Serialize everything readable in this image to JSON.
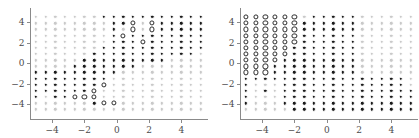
{
  "figure": {
    "type": "two-panel-scatter-grid",
    "width": 419,
    "height": 138,
    "panels": [
      "left",
      "right"
    ]
  },
  "axes": {
    "xticks": [
      -4,
      -2,
      0,
      2,
      4
    ],
    "xticklabels": [
      "-4",
      "-2",
      "0",
      "2",
      "4"
    ],
    "yticks": [
      -4,
      -2,
      0,
      2,
      4
    ],
    "yticklabels": [
      "-4",
      "-2",
      "0",
      "2",
      "4"
    ],
    "xlim": [
      -5.4,
      5.4
    ],
    "ylim": [
      -4.9,
      4.9
    ],
    "xlabel": "",
    "ylabel": "",
    "grid": false
  },
  "colors": {
    "dark": "#1a1a1a",
    "light": "#c9c9c9",
    "open_edge": "#2b2b2b",
    "open_face": "#ffffff",
    "axis": "#8a8a8a",
    "ticklabel": "#4a4a4a",
    "background": "#ffffff"
  },
  "markers": {
    "legend": {
      "filled-dark": "class-A-confident",
      "filled-light": "class-B-confident",
      "open": "support-vector"
    }
  },
  "chart_data": {
    "type": "scatter",
    "title": "",
    "subtitle": "",
    "xlabel": "",
    "ylabel": "",
    "xlim": [
      -5.4,
      5.4
    ],
    "ylim": [
      -4.9,
      4.9
    ],
    "xticks": [
      -4,
      -2,
      0,
      2,
      4
    ],
    "yticks": [
      -4,
      -2,
      0,
      2,
      4
    ],
    "grid": false,
    "legend_position": "none",
    "grid_spec": {
      "x_values": [
        -5,
        -4.4,
        -3.8,
        -3.2,
        -2.6,
        -2,
        -1.4,
        -0.8,
        -0.2,
        0.4,
        1.0,
        1.6,
        2.2,
        2.8,
        3.4,
        4.0,
        4.6,
        5.2
      ],
      "y_values": [
        4.5,
        3.9,
        3.3,
        2.7,
        2.1,
        1.5,
        0.9,
        0.3,
        -0.3,
        -0.9,
        -1.5,
        -2.1,
        -2.7,
        -3.3,
        -3.9,
        -4.5
      ],
      "ncols": 18,
      "nrows": 16
    },
    "panels": [
      {
        "name": "left",
        "description": "Decision-region grid; dark markers upper-right and lower-left bands, light markers elsewhere, open circles trace the boundary.",
        "rows": [
          "LLLLLLLDDDDDDDDDDD",
          "LLLLLLLLDDOLODDDDD",
          "LLLLLLLLDLOLODDDDD",
          "LLLLLLLLDODDDDDDDD",
          "LLLLLLLLDDDODDDDDD",
          "LLLLLLLDDDDDDDDDDD",
          "LLLLLLDDDDDDDDDDDL",
          "LLLLLDDDDDDDDDLLLL",
          "LLLLDDDDDDDLLLLLLL",
          "DDDDDDDDDLLLLLLLLL",
          "DDDDDDDDLLLLLLLLLL",
          "DDDDDDDOLLLLLLLLLL",
          "DDDDDDOLLLLLLLLLLL",
          "DLDDOOOLLLLLLLLLLL",
          "LLLLLLDOOLLLLLLLLL",
          "LLLLLLLLLLLLLLLLLL"
        ]
      },
      {
        "name": "right",
        "description": "Decision-region grid; open circles fill the upper-left block, dark markers form a central vertical band, light markers at upper right.",
        "rows": [
          "OOOOOOLDDDDDLLLLLL",
          "OOOOOODDDDDDLLLLLL",
          "OOOOOODDDDDDLLLLLL",
          "OOOOOODDDDDDLLLLLL",
          "OOOOOODDDDDDLLLLLL",
          "OOOOODDDDDDDLLLLLL",
          "OOOOODDDDDDDLLLLLL",
          "OOOODDDDDDDDLLLLLL",
          "OOODDDDDDDDDLLLLLL",
          "OOODDDDDDDDDLLLLLL",
          "DDDDDDDDDDDDDDDDDL",
          "DLLLDDDDDDDDDDDDDL",
          "DLDLDDDDDDDDDDDDDD",
          "DLLLDDDDDDDDDDDDDD",
          "DLLLDDDDDDDDDDDDDD",
          "LLLLLDDDDDDDDDDDDD"
        ]
      }
    ]
  }
}
